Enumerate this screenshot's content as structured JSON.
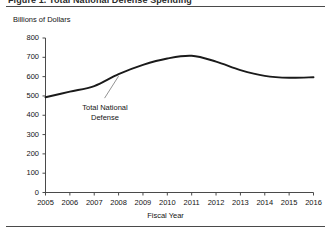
{
  "figure": {
    "title_fragment": "Figure 1. Total National Defense Spending",
    "y_axis_unit_label": "Billions of Dollars",
    "annotation_label": "Total National\nDefense",
    "x_axis_title": "Fiscal Year",
    "line_color": "#1a1a1a",
    "axis_color": "#4a4a4a",
    "rule_color": "#4a4a4a",
    "background_color": "#ffffff"
  },
  "chart_data": {
    "type": "line",
    "title": "Figure 1. Total National Defense Spending",
    "xlabel": "Fiscal Year",
    "ylabel": "Billions of Dollars",
    "x": [
      2005,
      2006,
      2007,
      2008,
      2009,
      2010,
      2011,
      2012,
      2013,
      2014,
      2015,
      2016
    ],
    "categories": [
      "2005",
      "2006",
      "2007",
      "2008",
      "2009",
      "2010",
      "2011",
      "2012",
      "2013",
      "2014",
      "2015",
      "2016"
    ],
    "series": [
      {
        "name": "Total National Defense",
        "values": [
          493,
          522,
          551,
          613,
          661,
          694,
          708,
          678,
          634,
          604,
          594,
          597
        ]
      }
    ],
    "xlim": [
      2005,
      2016
    ],
    "ylim": [
      0,
      800
    ],
    "yticks": [
      0,
      100,
      200,
      300,
      400,
      500,
      600,
      700,
      800
    ],
    "ytick_labels": [
      "0",
      "100",
      "200",
      "300",
      "400",
      "500",
      "600",
      "700",
      "800"
    ],
    "xticks": [
      2005,
      2006,
      2007,
      2008,
      2009,
      2010,
      2011,
      2012,
      2013,
      2014,
      2015,
      2016
    ],
    "xtick_labels": [
      "2005",
      "2006",
      "2007",
      "2008",
      "2009",
      "2010",
      "2011",
      "2012",
      "2013",
      "2014",
      "2015",
      "2016"
    ],
    "grid": false,
    "legend": "none",
    "annotations": [
      {
        "text": "Total National\nDefense",
        "points_to_year": 2008,
        "points_to_value": 613
      }
    ]
  }
}
